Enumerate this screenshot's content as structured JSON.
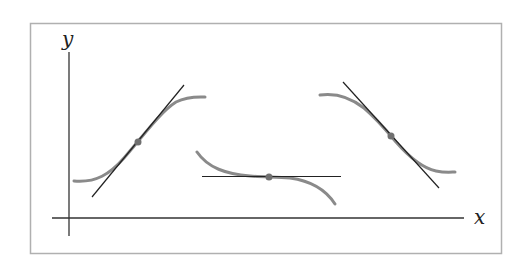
{
  "figure": {
    "type": "tangent-lines-illustration",
    "x_axis_label": "x",
    "y_axis_label": "y",
    "colors": {
      "frame": "#b0b0b0",
      "axes": "#333333",
      "curves": "#8a8a8a",
      "tangents": "#222222",
      "points": "#707070"
    },
    "panels": [
      {
        "name": "increasing",
        "description": "curve with positive slope at point, tangent line rising",
        "point": [
          138,
          142
        ],
        "tangent_slope_sign": "positive"
      },
      {
        "name": "stationary",
        "description": "curve with horizontal tangent (inflection) at point",
        "point": [
          269,
          177
        ],
        "tangent_slope_sign": "zero"
      },
      {
        "name": "decreasing",
        "description": "curve with negative slope at point, tangent line falling",
        "point": [
          391,
          136
        ],
        "tangent_slope_sign": "negative"
      }
    ]
  }
}
